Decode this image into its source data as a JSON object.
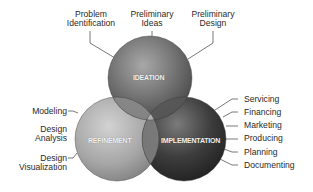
{
  "diagram": {
    "type": "venn",
    "circles": [
      {
        "id": "ideation",
        "label": "IDEATION",
        "color": "#6e6e6e",
        "items": [
          "Problem Identification",
          "Preliminary Ideas",
          "Preliminary Design"
        ]
      },
      {
        "id": "refinement",
        "label": "REFINEMENT",
        "color": "#a4a4a4",
        "items": [
          "Modeling",
          "Design Analysis",
          "Design Visualization"
        ]
      },
      {
        "id": "implementation",
        "label": "IMPLEMENTATION",
        "color": "#3a3a3a",
        "items": [
          "Servicing",
          "Financing",
          "Marketing",
          "Producing",
          "Planning",
          "Documenting"
        ]
      }
    ]
  },
  "labels": {
    "ideation": {
      "problem_line1": "Problem",
      "problem_line2": "Identification",
      "ideas_line1": "Preliminary",
      "ideas_line2": "Ideas",
      "design_line1": "Preliminary",
      "design_line2": "Design"
    },
    "refinement": {
      "modeling": "Modeling",
      "analysis_line1": "Design",
      "analysis_line2": "Analysis",
      "visualization_line1": "Design",
      "visualization_line2": "Visualization"
    },
    "implementation": {
      "servicing": "Servicing",
      "financing": "Financing",
      "marketing": "Marketing",
      "producing": "Producing",
      "planning": "Planning",
      "documenting": "Documenting"
    },
    "circles": {
      "ideation": "IDEATION",
      "refinement": "REFINEMENT",
      "implementation": "IMPLEMENTATION"
    }
  }
}
